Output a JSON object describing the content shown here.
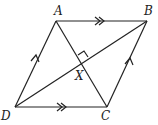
{
  "diagram": {
    "type": "parallelogram (rhombus) with diagonals",
    "points": {
      "A": {
        "label": "A",
        "x": 56,
        "y": 21
      },
      "B": {
        "label": "B",
        "x": 147,
        "y": 21
      },
      "C": {
        "label": "C",
        "x": 107,
        "y": 107
      },
      "D": {
        "label": "D",
        "x": 15,
        "y": 107
      },
      "X": {
        "label": "X",
        "x": 81,
        "y": 65
      }
    },
    "segments": [
      "AB",
      "BC",
      "CD",
      "DA",
      "AC",
      "BD"
    ],
    "markings": {
      "double_arrows": [
        "AB",
        "DC"
      ],
      "single_arrows": [
        "DA",
        "CB"
      ],
      "right_angle_at": "X"
    },
    "stroke_color": "#222222"
  }
}
